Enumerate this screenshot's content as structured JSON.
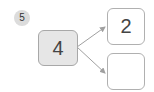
{
  "problem": {
    "number": "5"
  },
  "diagram": {
    "source_value": "4",
    "branches": [
      {
        "value": "2"
      },
      {
        "value": ""
      }
    ]
  },
  "colors": {
    "badge_bg": "#dcdcdc",
    "source_bg": "#e6e6e6",
    "border": "#b0b0b0",
    "arrow": "#a0a0a0"
  }
}
